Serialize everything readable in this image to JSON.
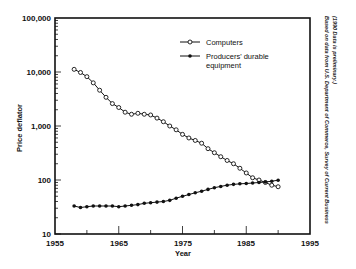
{
  "chart_data": {
    "type": "line",
    "title": "",
    "xlabel": "Year",
    "ylabel": "Price deflator",
    "xlim": [
      1955,
      1995
    ],
    "ylim": [
      10,
      100000
    ],
    "yscale": "log",
    "x_ticks": [
      "1955",
      "1965",
      "1975",
      "1985",
      "1995"
    ],
    "y_ticks": [
      "10",
      "100",
      "1,000",
      "10,000",
      "100,000"
    ],
    "grid": false,
    "legend_position": "upper right",
    "x": [
      1958,
      1959,
      1960,
      1961,
      1962,
      1963,
      1964,
      1965,
      1966,
      1967,
      1968,
      1969,
      1970,
      1971,
      1972,
      1973,
      1974,
      1975,
      1976,
      1977,
      1978,
      1979,
      1980,
      1981,
      1982,
      1983,
      1984,
      1985,
      1986,
      1987,
      1988,
      1989,
      1990
    ],
    "series": [
      {
        "name": "Computers",
        "marker": "open-circle",
        "values": [
          11200,
          9800,
          8200,
          6300,
          4600,
          3400,
          2600,
          2200,
          1800,
          1650,
          1720,
          1650,
          1600,
          1400,
          1200,
          1000,
          850,
          700,
          600,
          540,
          480,
          380,
          320,
          270,
          230,
          200,
          165,
          135,
          110,
          100,
          90,
          80,
          75
        ]
      },
      {
        "name": "Producers' durable equipment",
        "marker": "filled-circle",
        "values": [
          33,
          31,
          32,
          33,
          33,
          33,
          33,
          32,
          33,
          34,
          35,
          37,
          38,
          39,
          40,
          42,
          46,
          50,
          54,
          58,
          62,
          67,
          72,
          76,
          80,
          83,
          85,
          86,
          88,
          90,
          92,
          95,
          99
        ]
      }
    ],
    "legend": {
      "entries": [
        "Computers",
        "Producers' durable equipment"
      ]
    },
    "annotations": [
      "Based on data from U.S. Department of Commerce, Survey of Current Business",
      "(1990 Data is preliminary.)"
    ]
  },
  "labels": {
    "xlabel": "Year",
    "ylabel": "Price deflator",
    "x_ticks": [
      "1955",
      "1965",
      "1975",
      "1985",
      "1995"
    ],
    "y_ticks": [
      "100,000",
      "10,000",
      "1,000",
      "100",
      "10"
    ],
    "legend_computers": "Computers",
    "legend_producers_line1": "Producers' durable",
    "legend_producers_line2": "equipment",
    "source_line1": "Based on data from U.S. Department of Commerce, Survey of Current Business",
    "source_line2": "(1990 Data is preliminary.)"
  }
}
